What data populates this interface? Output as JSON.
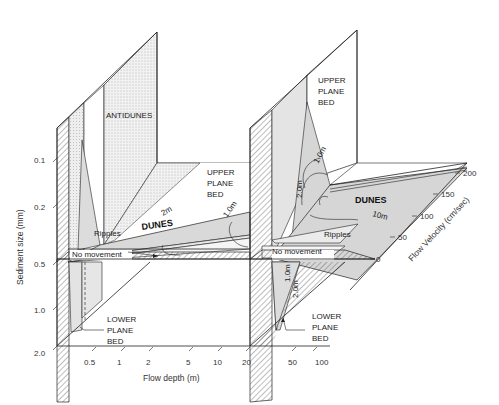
{
  "diagram": {
    "type": "3d-bedform-stability-diagram",
    "axes": {
      "sediment_size": {
        "label": "Sediment size (mm)",
        "ticks": [
          "0.1",
          "0.2",
          "0.5",
          "1.0",
          "2.0"
        ]
      },
      "flow_depth": {
        "label": "Flow depth (m)",
        "ticks": [
          "0.5",
          "1",
          "2",
          "5",
          "10",
          "20"
        ]
      },
      "flow_velocity": {
        "label": "Flow Velocity (cm/sec)",
        "ticks": [
          "0",
          "50",
          "100",
          "150",
          "200"
        ]
      },
      "lower_velocity_ticks": [
        "0",
        "50",
        "100"
      ]
    },
    "regions": {
      "antidunes": "ANTIDUNES",
      "upper_plane_bed_left": [
        "UPPER",
        "PLANE",
        "BED"
      ],
      "upper_plane_bed_right": [
        "UPPER",
        "PLANE",
        "BED"
      ],
      "dunes_left": "DUNES",
      "dunes_right": "DUNES",
      "ripples_left": "Ripples",
      "ripples_right": "Ripples",
      "no_movement_left": "No movement",
      "no_movement_right": "No movement",
      "lower_plane_bed_left": [
        "LOWER",
        "PLANE",
        "BED"
      ],
      "lower_plane_bed_right": [
        "LOWER",
        "PLANE",
        "BED"
      ]
    },
    "contours": {
      "left_floor": [
        "2m",
        "1.0m"
      ],
      "right_wall": [
        "1.0m",
        "2.0m"
      ],
      "right_floor": [
        "10m"
      ],
      "right_lower": [
        "1.0m",
        "2.0m"
      ]
    }
  }
}
